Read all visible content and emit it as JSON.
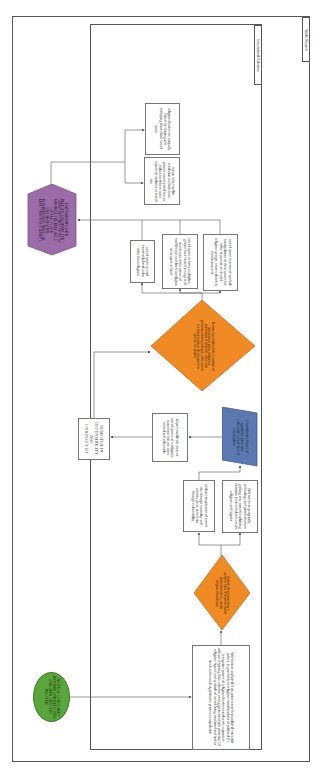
{
  "frames": {
    "outer_label": "World Devised",
    "inner_label": "International Relations"
  },
  "colors": {
    "start": "#5aa63c",
    "decision": "#f08a24",
    "process_highlight": "#5b78b0",
    "end": "#9c6ca8",
    "line": "#555555"
  },
  "nodes": {
    "start": {
      "shape": "ellipse",
      "text": "TEXTUAL CATEGORIES DEFINED AND RELIGIOUS AND OPEN ARTICLES RELATED"
    },
    "intro_box": {
      "shape": "rectangle",
      "text": "differentiate analytical from prior research in political scientific sphere, it goes back to religious considerations of political (1) recognizes power of religious leaders to influence supporters without requiring them adherent to engage in interfaith proactive (2) religious figures and symbols of sacred bring combined and tied to ritual and mutual significance prior to manipulation"
    },
    "decision_1": {
      "shape": "diamond",
      "text": "Outlook: Being sometimes a sacred as value in favour of shared global alternatives, secular religious determinants"
    },
    "branch_a": {
      "shape": "rectangle",
      "text": "evaluate importance of sacred site through centrality and sanctity on of sacred site through vulnerability"
    },
    "branch_b": {
      "shape": "rectangle",
      "text": "differences in geography, technology and parish structure go long way toward explaining variation in sacred places across religions and regions"
    },
    "highlight": {
      "shape": "parallelogram",
      "text": "a constitutive theory of significant parts and vulnerable sacred sites of sacred place"
    },
    "impact_box": {
      "shape": "rectangle",
      "text": "impact conflict in areas of sacred spaces of a religious movement that are most central and vulnerable"
    },
    "determinants": {
      "shape": "rectangle",
      "text": "DEMOTER IN DEFENSIBILITY ARE UNRESOLVED"
    },
    "decision_2": {
      "shape": "diamond",
      "text": "In some cases indivisibility is product of interaction of actors, product of constitution of identities, values and preferences during a dispute, other cases it is a characteristic of the religious law governs the property"
    },
    "outcome_a": {
      "shape": "rectangle",
      "text": "sacred space as void exists only local value other than religious"
    },
    "outcome_b": {
      "shape": "rectangle",
      "text": "sacred space as force multiplier: groups have served as targets of attack even when nature of conflict was unrelated to religion or to space at hand"
    },
    "outcome_c": {
      "shape": "rectangle",
      "text": "sacred space as arena of symbol: manipulation of these spaces for value or pursuit of secured religious groups, actors related to secular interests"
    },
    "end": {
      "shape": "hexagon",
      "text": "PARTNERSHIPS WITH RELIGIOUS LEADERS AND COMMUNITY PRACTICES TO MINIMIZE THE RELIGIOUS CONFLICTS AND COLLABORATIVE INTERVENTION THROUGH EFFECTIVE MANAGEMENT"
    },
    "result_a": {
      "shape": "rectangle",
      "text": "reason why conflict resolution methods have proven unsuccessful has to failure to address most aspects of violence at sacred site"
    },
    "result_b": {
      "shape": "rectangle",
      "text": "religious leaders are uniquely suited for shaping and reshaping ideas about sacred space"
    }
  }
}
